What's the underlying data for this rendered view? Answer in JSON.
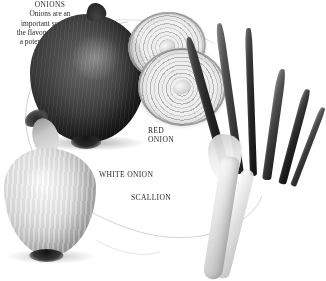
{
  "plate": {
    "subject": "onions",
    "background_color": "#ffffff",
    "text_color": "#2e2b29",
    "style": "grayscale photographic plate"
  },
  "specimens": [
    {
      "key": "red-onion",
      "name": "red-onion",
      "label": "RED\nONION",
      "label_lines": [
        "RED",
        "ONION"
      ]
    },
    {
      "key": "onion-slices",
      "name": "onion-slices",
      "label": "",
      "label_lines": []
    },
    {
      "key": "white-onion",
      "name": "white-onion",
      "label": "WHITE ONION",
      "label_lines": [
        "WHITE ONION"
      ]
    },
    {
      "key": "scallion",
      "name": "scallion",
      "label": "SCALLION",
      "label_lines": [
        "SCALLION"
      ]
    }
  ],
  "labels": {
    "red_onion_line1": "RED",
    "red_onion_line2": "ONION",
    "white_onion": "WHITE ONION",
    "scallion": "SCALLION"
  },
  "caption": {
    "title": "ONIONS",
    "line1": "Onions are an",
    "line2": "important source of",
    "line3": "the flavonol quercetin,",
    "line4": "a potent antioxidant.",
    "full_text": "ONIONS Onions are an important source of the flavonol quercetin, a potent antioxidant."
  }
}
